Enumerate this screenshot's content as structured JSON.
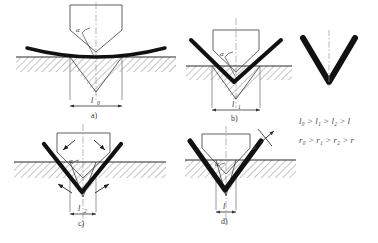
{
  "figure": {
    "caption_faint": "",
    "colors": {
      "sheet": "#111111",
      "outline": "#3a3a3a",
      "hatch": "#555555",
      "centerline": "#777777",
      "dimension": "#333333",
      "text": "#3a3a3a",
      "background": "#ffffff"
    }
  },
  "panels": [
    {
      "id": "a",
      "label": "a)",
      "dimension_label": "l",
      "dimension_sub": "0",
      "angle_label": "α",
      "stage": "initial-free-bending",
      "description": "Flat sheet slightly curved over wide die opening, punch descending"
    },
    {
      "id": "b",
      "label": "b)",
      "dimension_label": "l",
      "dimension_sub": "1",
      "angle_label": "α",
      "stage": "partial-bending",
      "description": "Sheet bent into shallow V, contact narrowing"
    },
    {
      "id": "c",
      "label": "c)",
      "dimension_label": "l",
      "dimension_sub": "2",
      "angle_label": "α",
      "stage": "near-final-bending",
      "description": "Sheet bent into deep V with four reaction force arrows"
    },
    {
      "id": "d",
      "label": "d)",
      "dimension_label": "l",
      "dimension_sub": "",
      "angle_label": "α",
      "stage": "final-coining",
      "description": "Fully formed sharp V-bend seated in die"
    }
  ],
  "reference": {
    "name": "finished-v-part",
    "description": "Finished V-shaped bent part with vertical centerline"
  },
  "relations": [
    {
      "id": "length-relation",
      "terms": [
        "l",
        "l",
        "l",
        "l"
      ],
      "subs": [
        "0",
        "1",
        "2",
        ""
      ],
      "operators": [
        ">",
        ">",
        ">"
      ],
      "text": "l₀ > l₁ > l₂ > l"
    },
    {
      "id": "radius-relation",
      "terms": [
        "r",
        "r",
        "r",
        "r"
      ],
      "subs": [
        "0",
        "1",
        "2",
        ""
      ],
      "operators": [
        ">",
        ">",
        ">"
      ],
      "text": "r₀ > r₁ > r₂ > r"
    }
  ]
}
